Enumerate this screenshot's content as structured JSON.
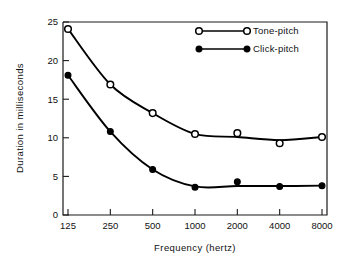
{
  "chart_data": {
    "type": "line",
    "title": "",
    "xlabel": "Frequency (hertz)",
    "ylabel": "Duration in milliseconds",
    "x": [
      125,
      250,
      500,
      1000,
      2000,
      4000,
      8000
    ],
    "xtick_labels": [
      "125",
      "250",
      "500",
      "1000",
      "2000",
      "4000",
      "8000"
    ],
    "xscale": "log",
    "ytick_labels": [
      "0",
      "5",
      "10",
      "15",
      "20",
      "25"
    ],
    "yticks": [
      0,
      5,
      10,
      15,
      20,
      25
    ],
    "ylim": [
      0,
      25
    ],
    "grid": false,
    "legend_position": "top-right",
    "series": [
      {
        "name": "Tone-pitch",
        "marker": "open-circle",
        "values": [
          24.1,
          16.9,
          13.2,
          10.5,
          10.6,
          9.3,
          10.1
        ]
      },
      {
        "name": "Click-pitch",
        "marker": "filled-circle",
        "values": [
          18.1,
          10.8,
          5.9,
          3.6,
          4.3,
          3.7,
          3.8
        ]
      }
    ]
  },
  "legend": {
    "items": [
      {
        "label": "Tone-pitch",
        "marker": "open-circle"
      },
      {
        "label": "Click-pitch",
        "marker": "filled-circle"
      }
    ]
  },
  "axes": {
    "x_title": "Frequency (hertz)",
    "y_title": "Duration in milliseconds"
  }
}
